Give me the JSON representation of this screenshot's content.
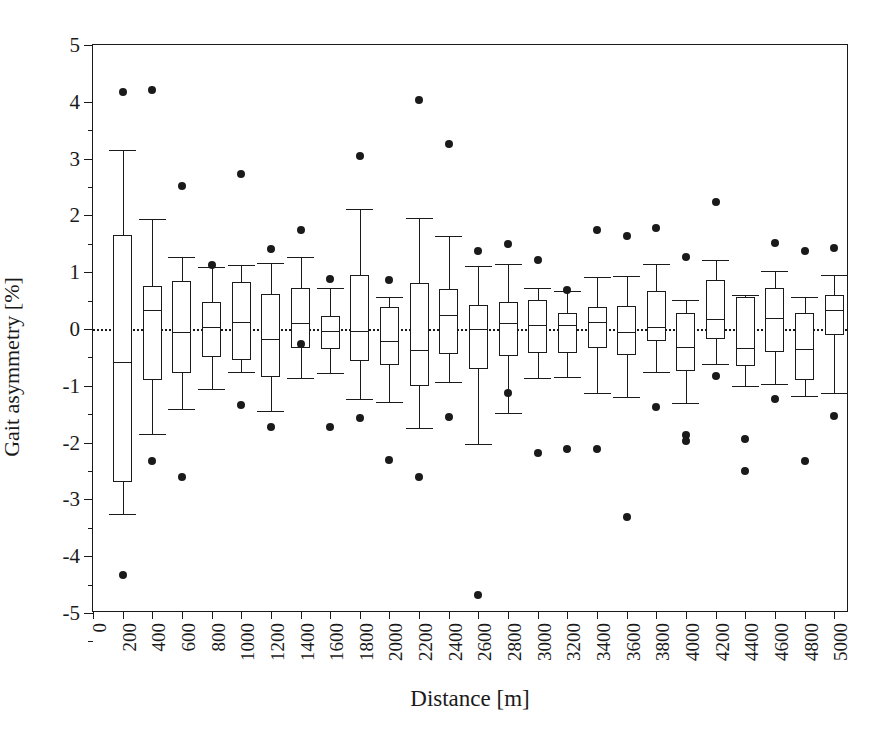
{
  "chart_data": {
    "type": "box",
    "title": "",
    "xlabel": "Distance [m]",
    "ylabel": "Gait asymmetry [%]",
    "xlim": [
      0,
      5100
    ],
    "ylim": [
      -5,
      5
    ],
    "yticks": [
      -5,
      -4,
      -3,
      -2,
      -1,
      0,
      1,
      2,
      3,
      4,
      5
    ],
    "ytick_labels": [
      "-5",
      "-4",
      "-3",
      "-2",
      "-1",
      "0",
      "1",
      "2",
      "3",
      "4",
      "5"
    ],
    "xticks": [
      0,
      200,
      400,
      600,
      800,
      1000,
      1200,
      1400,
      1600,
      1800,
      2000,
      2200,
      2400,
      2600,
      2800,
      3000,
      3200,
      3400,
      3600,
      3800,
      4000,
      4200,
      4400,
      4600,
      4800,
      5000
    ],
    "xtick_labels": [
      "0",
      "200",
      "400",
      "600",
      "800",
      "1000",
      "1200",
      "1400",
      "1600",
      "1800",
      "2000",
      "2200",
      "2400",
      "2600",
      "2800",
      "3000",
      "3200",
      "3400",
      "3600",
      "3800",
      "4000",
      "4200",
      "4400",
      "4600",
      "4800",
      "5000"
    ],
    "grid": false,
    "reference_line": 0,
    "reference_line_style": "dotted",
    "legend": "none",
    "box_color": "#ffffff",
    "line_color": "#1a1a1a",
    "outlier_color": "#1a1a1a",
    "boxes": [
      {
        "x": 200,
        "whisker_low": -3.25,
        "q1": -2.7,
        "median": -0.58,
        "q3": 1.66,
        "whisker_high": 3.15,
        "outliers": [
          4.18,
          -4.33
        ]
      },
      {
        "x": 400,
        "whisker_low": -1.85,
        "q1": -0.9,
        "median": 0.34,
        "q3": 0.75,
        "whisker_high": 1.94,
        "outliers": [
          4.21,
          -2.33
        ]
      },
      {
        "x": 600,
        "whisker_low": -1.4,
        "q1": -0.78,
        "median": -0.05,
        "q3": 0.85,
        "whisker_high": 1.27,
        "outliers": [
          2.52,
          -2.6
        ]
      },
      {
        "x": 800,
        "whisker_low": -1.05,
        "q1": -0.5,
        "median": 0.03,
        "q3": 0.47,
        "whisker_high": 1.09,
        "outliers": [
          1.13
        ]
      },
      {
        "x": 1000,
        "whisker_low": -0.76,
        "q1": -0.55,
        "median": 0.13,
        "q3": 0.83,
        "whisker_high": 1.13,
        "outliers": [
          2.73,
          -1.33
        ]
      },
      {
        "x": 1200,
        "whisker_low": -1.45,
        "q1": -0.85,
        "median": -0.18,
        "q3": 0.61,
        "whisker_high": 1.17,
        "outliers": [
          1.41,
          -1.73
        ]
      },
      {
        "x": 1400,
        "whisker_low": -0.87,
        "q1": -0.33,
        "median": 0.11,
        "q3": 0.73,
        "whisker_high": 1.26,
        "outliers": [
          1.75,
          -0.26
        ]
      },
      {
        "x": 1600,
        "whisker_low": -0.78,
        "q1": -0.35,
        "median": -0.04,
        "q3": 0.23,
        "whisker_high": 0.73,
        "outliers": [
          0.88,
          -1.72
        ]
      },
      {
        "x": 1800,
        "whisker_low": -1.23,
        "q1": -0.56,
        "median": -0.04,
        "q3": 0.95,
        "whisker_high": 2.11,
        "outliers": [
          3.05,
          -1.57
        ]
      },
      {
        "x": 2000,
        "whisker_low": -1.28,
        "q1": -0.63,
        "median": -0.21,
        "q3": 0.38,
        "whisker_high": 0.57,
        "outliers": [
          0.86,
          -2.3
        ]
      },
      {
        "x": 2200,
        "whisker_low": -1.74,
        "q1": -1.0,
        "median": -0.37,
        "q3": 0.81,
        "whisker_high": 1.96,
        "outliers": [
          4.03,
          -2.61
        ]
      },
      {
        "x": 2400,
        "whisker_low": -0.93,
        "q1": -0.44,
        "median": 0.25,
        "q3": 0.7,
        "whisker_high": 1.63,
        "outliers": [
          3.26,
          -1.55
        ]
      },
      {
        "x": 2600,
        "whisker_low": -2.02,
        "q1": -0.71,
        "median": 0.0,
        "q3": 0.43,
        "whisker_high": 1.11,
        "outliers": [
          1.38,
          -4.69
        ]
      },
      {
        "x": 2800,
        "whisker_low": -1.48,
        "q1": -0.48,
        "median": 0.1,
        "q3": 0.48,
        "whisker_high": 1.15,
        "outliers": [
          1.5,
          -1.13
        ]
      },
      {
        "x": 3000,
        "whisker_low": -0.87,
        "q1": -0.42,
        "median": 0.07,
        "q3": 0.51,
        "whisker_high": 0.72,
        "outliers": [
          1.21,
          -2.18
        ]
      },
      {
        "x": 3200,
        "whisker_low": -0.85,
        "q1": -0.43,
        "median": 0.07,
        "q3": 0.28,
        "whisker_high": 0.67,
        "outliers": [
          0.68,
          -2.12
        ]
      },
      {
        "x": 3400,
        "whisker_low": -1.13,
        "q1": -0.34,
        "median": 0.13,
        "q3": 0.39,
        "whisker_high": 0.92,
        "outliers": [
          1.74,
          -2.12
        ]
      },
      {
        "x": 3600,
        "whisker_low": -1.19,
        "q1": -0.46,
        "median": -0.05,
        "q3": 0.4,
        "whisker_high": 0.93,
        "outliers": [
          1.64,
          -3.31
        ]
      },
      {
        "x": 3800,
        "whisker_low": -0.76,
        "q1": -0.21,
        "median": 0.04,
        "q3": 0.67,
        "whisker_high": 1.14,
        "outliers": [
          1.77,
          -1.37
        ]
      },
      {
        "x": 4000,
        "whisker_low": -1.3,
        "q1": -0.74,
        "median": -0.31,
        "q3": 0.29,
        "whisker_high": 0.51,
        "outliers": [
          1.26,
          -1.86,
          -1.97
        ]
      },
      {
        "x": 4200,
        "whisker_low": -0.62,
        "q1": -0.17,
        "median": 0.18,
        "q3": 0.87,
        "whisker_high": 1.22,
        "outliers": [
          2.24,
          -0.83
        ]
      },
      {
        "x": 4400,
        "whisker_low": -1.0,
        "q1": -0.66,
        "median": -0.33,
        "q3": 0.57,
        "whisker_high": 0.6,
        "outliers": [
          -1.94,
          -2.5
        ]
      },
      {
        "x": 4600,
        "whisker_low": -0.97,
        "q1": -0.4,
        "median": 0.19,
        "q3": 0.72,
        "whisker_high": 1.02,
        "outliers": [
          1.52,
          -1.23
        ]
      },
      {
        "x": 4800,
        "whisker_low": -1.18,
        "q1": -0.9,
        "median": -0.35,
        "q3": 0.28,
        "whisker_high": 0.57,
        "outliers": [
          1.37,
          -2.33
        ]
      },
      {
        "x": 5000,
        "whisker_low": -1.13,
        "q1": -0.1,
        "median": 0.33,
        "q3": 0.6,
        "whisker_high": 0.95,
        "outliers": [
          1.43,
          -1.53
        ]
      }
    ]
  }
}
